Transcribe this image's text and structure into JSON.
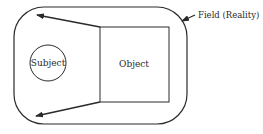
{
  "diagram": {
    "field": {
      "label": "Field (Reality)",
      "shape": "rounded-rectangle",
      "x": 14,
      "y": 7,
      "width": 173,
      "height": 117,
      "corner_radius": 30
    },
    "subject": {
      "label": "Subject",
      "shape": "circle",
      "cx": 48,
      "cy": 63,
      "r": 18
    },
    "object": {
      "label": "Object",
      "shape": "square",
      "x": 100,
      "y": 27,
      "width": 69,
      "height": 75
    },
    "arrows": [
      {
        "from": "object-top-left",
        "x1": 100,
        "y1": 27,
        "x2": 37,
        "y2": 15
      },
      {
        "from": "object-bottom-left",
        "x1": 100,
        "y1": 102,
        "x2": 36,
        "y2": 116
      },
      {
        "from": "field-label",
        "x1": 195,
        "y1": 15,
        "x2": 182,
        "y2": 21
      }
    ],
    "colors": {
      "stroke": "#2a2a2a",
      "background": "#ffffff"
    }
  }
}
